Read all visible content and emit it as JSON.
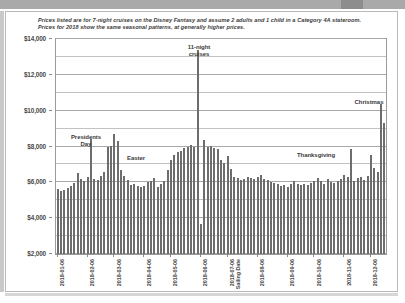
{
  "caption": "Prices listed are for 7-night cruises on the Disney Fantasy and assume 2 adults and 1 child in a Category 4A stateroom. Prices for 2018 show the same seasonal patterns, at generally higher prices.",
  "chart_data": {
    "type": "bar",
    "title": "",
    "xlabel": "Sailing Date",
    "ylabel": "",
    "ylim": [
      2000,
      14000
    ],
    "ytick_values": [
      2000,
      4000,
      6000,
      8000,
      10000,
      12000,
      14000
    ],
    "ytick_labels": [
      "$2,000",
      "$4,000",
      "$6,000",
      "$8,000",
      "$10,000",
      "$12,000",
      "$14,000"
    ],
    "minor_gridlines": true,
    "grid": true,
    "legend": "none",
    "bar_color": "#6d6d6d",
    "xtick_labels": [
      "2018-01-06",
      "2018-02-06",
      "2018-03-06",
      "2018-04-06",
      "2018-05-06",
      "2018-06-06",
      "2018-07-06",
      "2018-08-06",
      "2018-09-06",
      "2018-10-06",
      "2018-11-06",
      "2018-12-06"
    ],
    "xtick_indices": [
      0,
      9,
      17,
      26,
      34,
      43,
      51,
      60,
      69,
      77,
      86,
      94
    ],
    "values": [
      5650,
      5500,
      5600,
      5700,
      5800,
      5950,
      6500,
      6200,
      6100,
      6300,
      8400,
      6200,
      6150,
      6350,
      6550,
      7950,
      8050,
      8700,
      8300,
      6700,
      6350,
      6150,
      5850,
      5900,
      5800,
      5750,
      5800,
      6000,
      6100,
      6250,
      5750,
      5900,
      6050,
      6700,
      7250,
      7550,
      7700,
      7750,
      7900,
      8000,
      8100,
      8000,
      13400,
      3650,
      8350,
      8000,
      8050,
      7900,
      7850,
      7250,
      7100,
      7450,
      6750,
      6300,
      6250,
      6150,
      6200,
      6300,
      6250,
      6200,
      6300,
      6400,
      6200,
      6150,
      6000,
      5950,
      5900,
      5800,
      5850,
      5750,
      5900,
      6050,
      5900,
      5850,
      5900,
      5850,
      5950,
      6050,
      6250,
      6100,
      5900,
      6200,
      6000,
      5950,
      6050,
      6200,
      6400,
      6300,
      7850,
      6050,
      6250,
      6300,
      6150,
      6350,
      7500,
      6800,
      6600,
      10350,
      9300
    ]
  },
  "annotations": [
    {
      "id": "presidents-day",
      "text": "Presidents\nDay"
    },
    {
      "id": "easter",
      "text": "Easter"
    },
    {
      "id": "eleven-night-cruises",
      "text": "11-night\ncruises"
    },
    {
      "id": "thanksgiving",
      "text": "Thanksgiving"
    },
    {
      "id": "christmas",
      "text": "Christmas"
    }
  ]
}
